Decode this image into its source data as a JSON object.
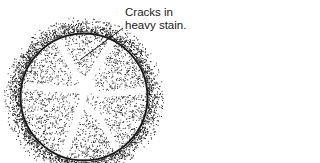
{
  "figure": {
    "annotation": {
      "line1": "Cracks in",
      "line2": "heavy stain."
    },
    "colors": {
      "ink": "#1a1a1a",
      "background": "#ffffff"
    },
    "specimen": {
      "center": [
        84,
        97
      ],
      "rim_radius": 64,
      "halo_outer_radius": 79,
      "crack_count": 5
    }
  }
}
